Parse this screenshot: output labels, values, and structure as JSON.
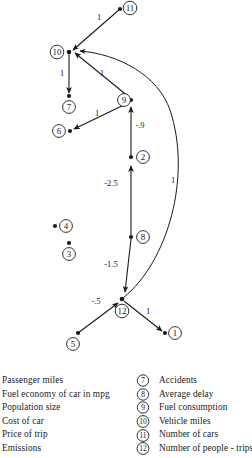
{
  "figure": {
    "type": "signed-directed-graph",
    "title": "",
    "nodes": [
      {
        "id": "1",
        "label": "1",
        "x": 175,
        "y": 333,
        "dot_x": 165,
        "dot_y": 333
      },
      {
        "id": "2",
        "label": "2",
        "x": 143,
        "y": 157,
        "dot_x": 131,
        "dot_y": 157
      },
      {
        "id": "3",
        "label": "3",
        "x": 69,
        "y": 254,
        "dot_x": 69,
        "dot_y": 243
      },
      {
        "id": "4",
        "label": "4",
        "x": 66,
        "y": 226,
        "dot_x": 55,
        "dot_y": 226
      },
      {
        "id": "5",
        "label": "5",
        "x": 73,
        "y": 344,
        "dot_x": 78,
        "dot_y": 333
      },
      {
        "id": "6",
        "label": "6",
        "x": 59,
        "y": 131,
        "dot_x": 70,
        "dot_y": 131
      },
      {
        "id": "7",
        "label": "7",
        "x": 69,
        "y": 107,
        "dot_x": 69,
        "dot_y": 96
      },
      {
        "id": "8",
        "label": "8",
        "x": 143,
        "y": 237,
        "dot_x": 131,
        "dot_y": 237
      },
      {
        "id": "9",
        "label": "9",
        "x": 124,
        "y": 100,
        "dot_x": 131,
        "dot_y": 100
      },
      {
        "id": "10",
        "label": "10",
        "x": 57,
        "y": 52,
        "dot_x": 69,
        "dot_y": 52
      },
      {
        "id": "11",
        "label": "11",
        "x": 130,
        "y": 8,
        "dot_x": 120,
        "dot_y": 9
      },
      {
        "id": "12",
        "label": "12",
        "x": 122,
        "y": 311,
        "dot_x": 122,
        "dot_y": 299
      }
    ],
    "edges": [
      {
        "from": "11",
        "to": "10",
        "weight": "1",
        "label_x": 99,
        "label_y": 17
      },
      {
        "from": "10",
        "to": "7",
        "weight": "1",
        "label_x": 62,
        "label_y": 73
      },
      {
        "from": "9",
        "to": "10",
        "weight": "1",
        "label_x": 102,
        "label_y": 73
      },
      {
        "from": "9",
        "to": "6",
        "weight": "1",
        "label_x": 97,
        "label_y": 113
      },
      {
        "from": "2",
        "to": "9",
        "weight": "-.9",
        "label_x": 139,
        "label_y": 125
      },
      {
        "from": "8",
        "to": "2",
        "weight": "-2.5",
        "label_x": 111,
        "label_y": 183
      },
      {
        "from": "12",
        "to": "8",
        "weight": "-1.5",
        "label_x": 111,
        "label_y": 264
      },
      {
        "from": "5",
        "to": "12",
        "weight": "-.5",
        "label_x": 96,
        "label_y": 301
      },
      {
        "from": "12",
        "to": "1",
        "weight": "1",
        "label_x": 148,
        "label_y": 311
      },
      {
        "from": "12",
        "to": "10",
        "weight": "1",
        "label_x": 172,
        "label_y": 180
      }
    ],
    "edge_weights": [
      "1",
      "1",
      "1",
      "1",
      "-.9",
      "-2.5",
      "-1.5",
      "-.5",
      "1",
      "1"
    ]
  },
  "legend": {
    "left_column": [
      {
        "label": "Passenger miles"
      },
      {
        "label": "Fuel economy of car in mpg"
      },
      {
        "label": "Population size"
      },
      {
        "label": "Cost of car"
      },
      {
        "label": "Price of trip"
      },
      {
        "label": "Emissions"
      }
    ],
    "right_column": [
      {
        "number": "7",
        "label": "Accidents"
      },
      {
        "number": "8",
        "label": "Average delay"
      },
      {
        "number": "9",
        "label": "Fuel consumption"
      },
      {
        "number": "10",
        "label": "Vehicle miles"
      },
      {
        "number": "11",
        "label": "Number of cars"
      },
      {
        "number": "12",
        "label": "Number of people - trips"
      }
    ]
  },
  "colors": {
    "ink": "#1a1a1a",
    "background": "#ffffff"
  }
}
